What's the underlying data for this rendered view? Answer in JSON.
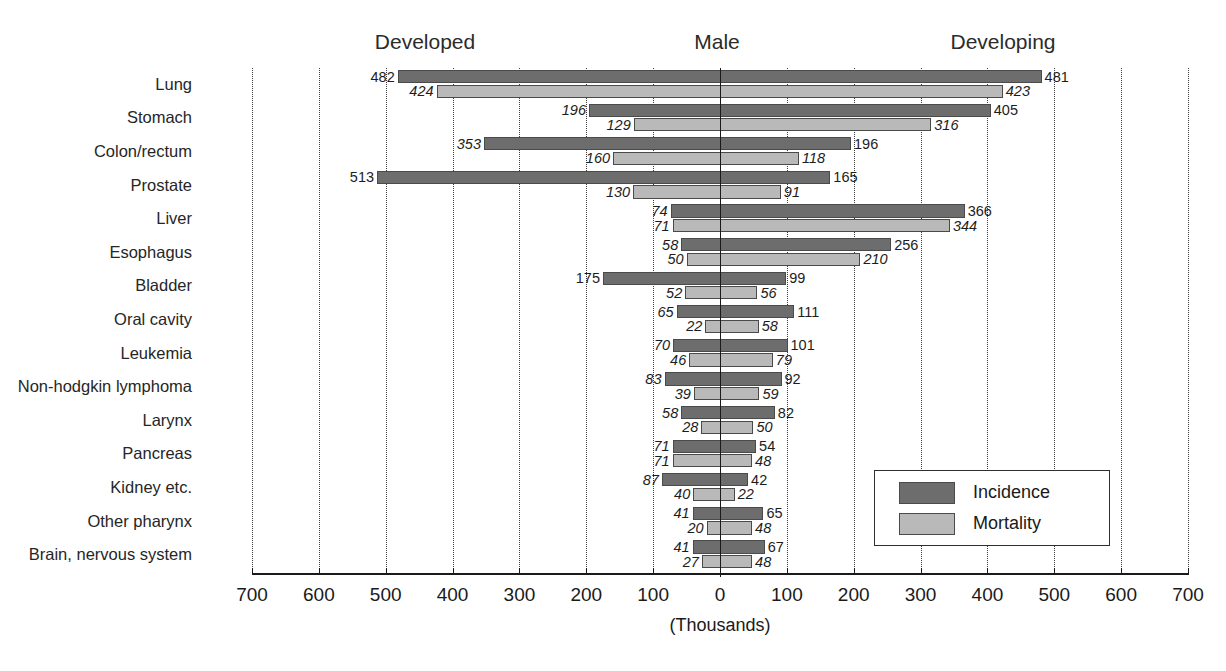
{
  "chart_data": {
    "type": "bar",
    "orientation": "horizontal",
    "style": "bidirectional-population-pyramid",
    "title": "Male",
    "subtitle": "",
    "xlabel": "(Thousands)",
    "ylabel": "",
    "left_region_label": "Developed",
    "right_region_label": "Developing",
    "center_label": "Male",
    "xlim": [
      -700,
      700
    ],
    "xticks": [
      700,
      600,
      500,
      400,
      300,
      200,
      100,
      0,
      100,
      200,
      300,
      400,
      500,
      600,
      700
    ],
    "xtick_labels": [
      "700",
      "600",
      "500",
      "400",
      "300",
      "200",
      "100",
      "0",
      "100",
      "200",
      "300",
      "400",
      "500",
      "600",
      "700"
    ],
    "grid": true,
    "grid_style": "dotted-vertical",
    "legend_position": "inside-lower-right",
    "legend": [
      "Incidence",
      "Mortality"
    ],
    "colors": {
      "incidence": "#6d6d6d",
      "mortality": "#b9b9b9",
      "axis": "#1a1a1a",
      "grid": "#3a3a3a",
      "background": "#ffffff"
    },
    "categories": [
      "Lung",
      "Stomach",
      "Colon/rectum",
      "Prostate",
      "Liver",
      "Esophagus",
      "Bladder",
      "Oral cavity",
      "Leukemia",
      "Non-hodgkin lymphoma",
      "Larynx",
      "Pancreas",
      "Kidney etc.",
      "Other pharynx",
      "Brain, nervous system"
    ],
    "series": [
      {
        "name": "Incidence",
        "side": "Developed",
        "direction": "left",
        "values": [
          482,
          196,
          353,
          513,
          74,
          58,
          175,
          65,
          70,
          83,
          58,
          71,
          87,
          41,
          41
        ]
      },
      {
        "name": "Mortality",
        "side": "Developed",
        "direction": "left",
        "values": [
          424,
          129,
          160,
          130,
          71,
          50,
          52,
          22,
          46,
          39,
          28,
          71,
          40,
          20,
          27
        ]
      },
      {
        "name": "Incidence",
        "side": "Developing",
        "direction": "right",
        "values": [
          481,
          405,
          196,
          165,
          366,
          256,
          99,
          111,
          101,
          92,
          82,
          54,
          42,
          65,
          67
        ]
      },
      {
        "name": "Mortality",
        "side": "Developing",
        "direction": "right",
        "values": [
          423,
          316,
          118,
          91,
          344,
          210,
          56,
          58,
          79,
          59,
          50,
          48,
          22,
          48,
          48
        ]
      }
    ],
    "rows": [
      {
        "category": "Lung",
        "dev_inc": 482,
        "dev_mor": 424,
        "ing_inc": 481,
        "ing_mor": 423
      },
      {
        "category": "Stomach",
        "dev_inc": 196,
        "dev_mor": 129,
        "ing_inc": 405,
        "ing_mor": 316
      },
      {
        "category": "Colon/rectum",
        "dev_inc": 353,
        "dev_mor": 160,
        "ing_inc": 196,
        "ing_mor": 118
      },
      {
        "category": "Prostate",
        "dev_inc": 513,
        "dev_mor": 130,
        "ing_inc": 165,
        "ing_mor": 91
      },
      {
        "category": "Liver",
        "dev_inc": 74,
        "dev_mor": 71,
        "ing_inc": 366,
        "ing_mor": 344
      },
      {
        "category": "Esophagus",
        "dev_inc": 58,
        "dev_mor": 50,
        "ing_inc": 256,
        "ing_mor": 210
      },
      {
        "category": "Bladder",
        "dev_inc": 175,
        "dev_mor": 52,
        "ing_inc": 99,
        "ing_mor": 56
      },
      {
        "category": "Oral cavity",
        "dev_inc": 65,
        "dev_mor": 22,
        "ing_inc": 111,
        "ing_mor": 58
      },
      {
        "category": "Leukemia",
        "dev_inc": 70,
        "dev_mor": 46,
        "ing_inc": 101,
        "ing_mor": 79
      },
      {
        "category": "Non-hodgkin lymphoma",
        "dev_inc": 83,
        "dev_mor": 39,
        "ing_inc": 92,
        "ing_mor": 59
      },
      {
        "category": "Larynx",
        "dev_inc": 58,
        "dev_mor": 28,
        "ing_inc": 82,
        "ing_mor": 50
      },
      {
        "category": "Pancreas",
        "dev_inc": 71,
        "dev_mor": 71,
        "ing_inc": 54,
        "ing_mor": 48
      },
      {
        "category": "Kidney etc.",
        "dev_inc": 87,
        "dev_mor": 40,
        "ing_inc": 42,
        "ing_mor": 22
      },
      {
        "category": "Other pharynx",
        "dev_inc": 41,
        "dev_mor": 20,
        "ing_inc": 65,
        "ing_mor": 48
      },
      {
        "category": "Brain, nervous system",
        "dev_inc": 41,
        "dev_mor": 27,
        "ing_inc": 67,
        "ing_mor": 48
      }
    ]
  }
}
